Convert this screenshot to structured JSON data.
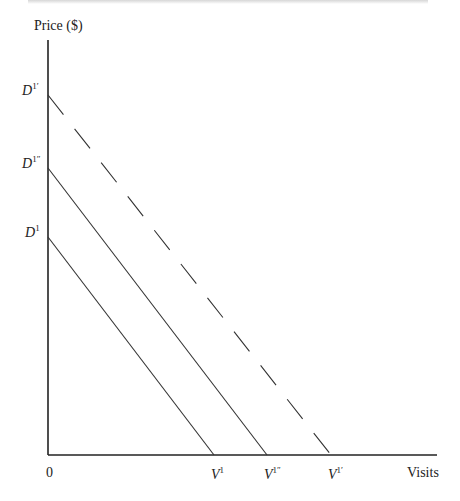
{
  "chart_data": {
    "type": "line",
    "title": "",
    "ylabel": "Price ($)",
    "xlabel": "Visits",
    "origin_label": "0",
    "grid": false,
    "legend": "none",
    "axes_px": {
      "origin": [
        48,
        455
      ],
      "y_top": 40,
      "x_right": 437
    },
    "series": [
      {
        "name": "D1",
        "label_base": "D",
        "label_sup": "1",
        "x_label_base": "V",
        "x_label_sup": "1",
        "style": "solid",
        "intercept_y_px": 237,
        "intercept_x_px": 214
      },
      {
        "name": "D1''",
        "label_base": "D",
        "label_sup": "1″",
        "x_label_base": "V",
        "x_label_sup": "1″",
        "style": "solid",
        "intercept_y_px": 168,
        "intercept_x_px": 267
      },
      {
        "name": "D1'",
        "label_base": "D",
        "label_sup": "1′",
        "x_label_base": "V",
        "x_label_sup": "1′",
        "style": "dashed",
        "intercept_y_px": 95,
        "intercept_x_px": 331
      }
    ],
    "line_color": "#333333",
    "axis_color": "#222222"
  }
}
